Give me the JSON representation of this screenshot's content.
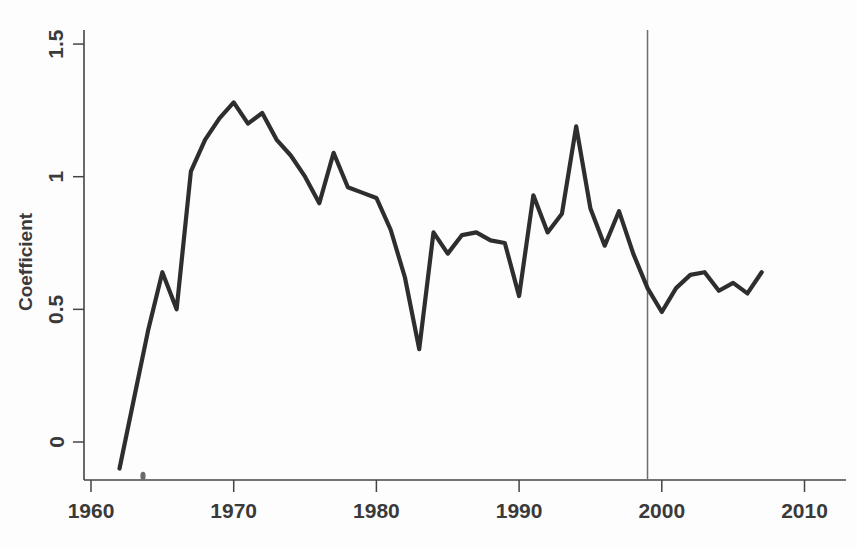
{
  "chart_data": {
    "type": "line",
    "title": "",
    "subtitle": "",
    "xlabel": "",
    "ylabel": "Coefficient",
    "xlim": [
      1958,
      2012
    ],
    "ylim": [
      -0.22,
      1.62
    ],
    "grid": false,
    "legend_position": "none",
    "x_ticks": [
      1960,
      1970,
      1980,
      1990,
      2000,
      2010
    ],
    "x_tick_labels": [
      "1960",
      "1970",
      "1980",
      "1990",
      "2000",
      "2010"
    ],
    "y_ticks": [
      0,
      0.5,
      1,
      1.5
    ],
    "y_tick_labels": [
      "0",
      "0.5",
      "1",
      "1.5"
    ],
    "annotations": [
      {
        "kind": "vertical-reference-line",
        "x": 1999,
        "label": ""
      }
    ],
    "series": [
      {
        "name": "Coefficient",
        "color": "#2e2e2e",
        "x": [
          1962,
          1963,
          1964,
          1965,
          1966,
          1967,
          1968,
          1969,
          1970,
          1971,
          1972,
          1973,
          1974,
          1975,
          1976,
          1977,
          1978,
          1979,
          1980,
          1981,
          1982,
          1983,
          1984,
          1985,
          1986,
          1987,
          1988,
          1989,
          1990,
          1991,
          1992,
          1993,
          1994,
          1995,
          1996,
          1997,
          1998,
          1999,
          2000,
          2001,
          2002,
          2003,
          2004,
          2005,
          2006,
          2007
        ],
        "y": [
          -0.1,
          0.16,
          0.42,
          0.64,
          0.5,
          1.02,
          1.14,
          1.22,
          1.28,
          1.2,
          1.24,
          1.14,
          1.08,
          1.0,
          0.9,
          1.09,
          0.96,
          0.94,
          0.92,
          0.8,
          0.62,
          0.35,
          0.79,
          0.71,
          0.78,
          0.79,
          0.76,
          0.75,
          0.55,
          0.93,
          0.79,
          0.86,
          1.19,
          0.88,
          0.74,
          0.87,
          0.71,
          0.58,
          0.49,
          0.58,
          0.63,
          0.64,
          0.57,
          0.6,
          0.56,
          0.64
        ]
      }
    ]
  },
  "axes": {
    "y_axis_title": "Coefficient"
  }
}
